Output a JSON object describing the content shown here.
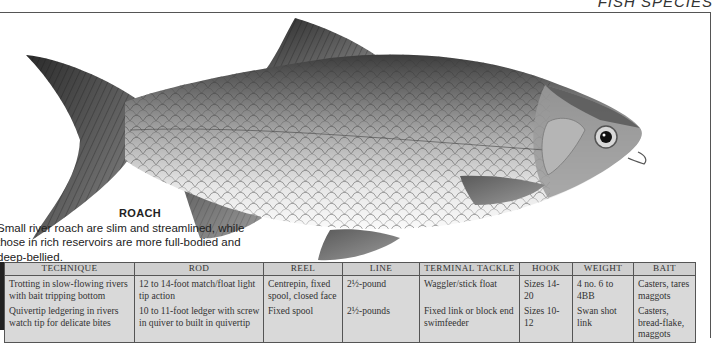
{
  "page": {
    "title": "FISH SPECIES"
  },
  "species": {
    "name": "ROACH",
    "description": "Small river roach are slim and streamlined, while those in rich reservoirs are more full-bodied and deep-bellied.",
    "illustration": "roach-fish-illustration"
  },
  "tackle_table": {
    "headers": [
      "TECHNIQUE",
      "ROD",
      "REEL",
      "LINE",
      "TERMINAL TACKLE",
      "HOOK",
      "WEIGHT",
      "BAIT"
    ],
    "rows": [
      {
        "technique": "Trotting in slow-flowing rivers with bait tripping bottom",
        "rod": "12 to 14-foot match/float light tip action",
        "reel": "Centrepin, fixed spool, closed face",
        "line": "2½-pound",
        "terminal_tackle": "Waggler/stick float",
        "hook": "Sizes 14-20",
        "weight": "4 no. 6 to 4BB",
        "bait": "Casters, tares maggots"
      },
      {
        "technique": "Quivertip ledgering in rivers watch tip for delicate bites",
        "rod": "10 to 11-foot ledger with screw in quiver to built in quivertip",
        "reel": "Fixed spool",
        "line": "2½-pounds",
        "terminal_tackle": "Fixed link or block end swimfeeder",
        "hook": "Sizes 10-12",
        "weight": "Swan shot link",
        "bait": "Casters, bread-flake, maggots"
      }
    ]
  },
  "colors": {
    "table_bg": "#d9d9d9",
    "table_header_bg": "#cfcfcf",
    "rule": "#555555"
  }
}
